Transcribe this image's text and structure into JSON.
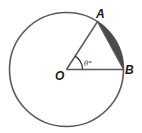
{
  "diagram": {
    "type": "geometry-circle-sector",
    "labels": {
      "center": "O",
      "point_a": "A",
      "point_b": "B",
      "angle": "θ°"
    },
    "colors": {
      "stroke": "#5a5a5a",
      "segment_fill": "#4a4a4a",
      "background": "#ffffff"
    }
  }
}
